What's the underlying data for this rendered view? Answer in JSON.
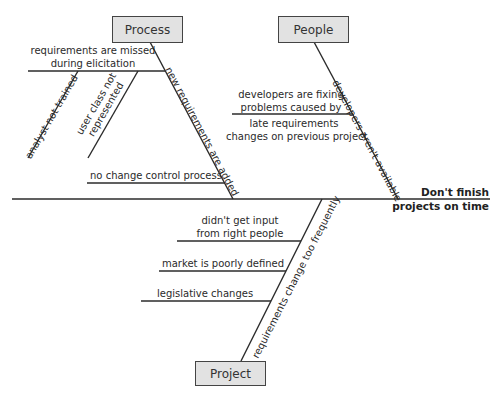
{
  "diagram": {
    "type": "fishbone",
    "effect": {
      "line1": "Don't finish",
      "line2": "projects on time"
    },
    "categories": {
      "process": {
        "label": "Process",
        "causes": {
          "missed": {
            "line1": "requirements are missed",
            "line2": "during elicitation",
            "subcauses": {
              "analyst": "analyst not trained",
              "userclass_line1": "user class not",
              "userclass_line2": "represented"
            }
          },
          "new_requirements": "new requirements are added",
          "no_change_control": "no change control process"
        }
      },
      "people": {
        "label": "People",
        "causes": {
          "developers_unavailable": "developers aren't available",
          "fixing": {
            "line1": "developers are fixing",
            "line2": "problems caused by",
            "line3": "late requirements",
            "line4": "changes on previous project"
          }
        }
      },
      "project": {
        "label": "Project",
        "causes": {
          "change_frequently": "requirements change too frequently",
          "input": {
            "line1": "didn't get input",
            "line2": "from right people"
          },
          "market": "market is poorly defined",
          "legislative": "legislative changes"
        }
      }
    },
    "colors": {
      "line": "#2b2b2b",
      "box_fill": "#e2e2e2",
      "box_border": "#444444",
      "background": "#ffffff"
    }
  }
}
